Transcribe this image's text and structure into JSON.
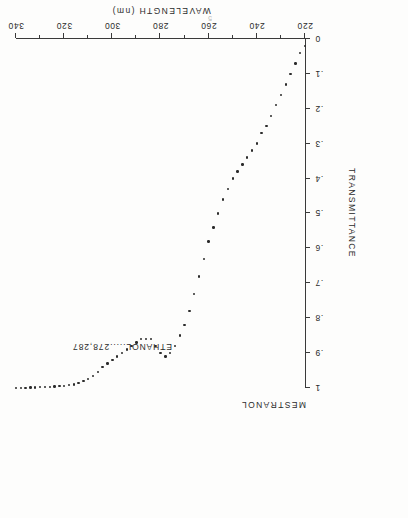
{
  "figure": {
    "title": "MESTRANOL",
    "solvent_annotation": "ETHANOL.....278,287",
    "page_mark": "5"
  },
  "chart_data": {
    "type": "scatter",
    "title": "MESTRANOL",
    "subtitle": "ETHANOL.....278,287",
    "xlabel": "WAVELENGTH (nm)",
    "ylabel": "TRANSMITTANCE",
    "xlim": [
      220,
      340
    ],
    "ylim": [
      0,
      1
    ],
    "xticks": [
      220,
      240,
      260,
      280,
      300,
      320,
      340
    ],
    "xticklabels": [
      "220",
      "240",
      "260",
      "280",
      "300",
      "320",
      "340"
    ],
    "yticks": [
      0,
      0.1,
      0.2,
      0.3,
      0.4,
      0.5,
      0.6,
      0.7,
      0.8,
      0.9,
      1
    ],
    "yticklabels": [
      "0",
      ".1",
      ".2",
      ".3",
      ".4",
      ".5",
      ".6",
      ".7",
      ".8",
      ".9",
      "1"
    ],
    "grid": false,
    "legend": "none",
    "annotations": [
      "ETHANOL.....278,287"
    ],
    "absorption_maxima_nm": [
      278,
      287
    ],
    "series": [
      {
        "name": "Mestranol transmittance",
        "marker": "dot",
        "color": "#2b2b2b",
        "x": [
          220,
          222,
          224,
          226,
          228,
          230,
          232,
          234,
          236,
          238,
          240,
          242,
          244,
          246,
          248,
          250,
          252,
          254,
          256,
          258,
          260,
          262,
          264,
          266,
          268,
          270,
          272,
          274,
          276,
          278,
          280,
          282,
          284,
          285,
          286,
          287,
          288,
          290,
          292,
          294,
          296,
          298,
          300,
          302,
          304,
          306,
          308,
          310,
          312,
          314,
          316,
          318,
          320,
          322,
          324,
          326,
          328,
          330,
          332,
          334,
          336,
          338,
          340
        ],
        "y": [
          0.02,
          0.04,
          0.07,
          0.1,
          0.13,
          0.16,
          0.19,
          0.22,
          0.25,
          0.27,
          0.3,
          0.32,
          0.34,
          0.36,
          0.38,
          0.4,
          0.43,
          0.46,
          0.5,
          0.54,
          0.58,
          0.63,
          0.68,
          0.73,
          0.78,
          0.82,
          0.85,
          0.88,
          0.9,
          0.91,
          0.9,
          0.88,
          0.86,
          0.86,
          0.86,
          0.86,
          0.86,
          0.87,
          0.88,
          0.89,
          0.9,
          0.91,
          0.92,
          0.93,
          0.94,
          0.955,
          0.965,
          0.975,
          0.98,
          0.985,
          0.99,
          0.992,
          0.994,
          0.995,
          0.996,
          0.997,
          0.998,
          0.998,
          0.999,
          0.999,
          1.0,
          1.0,
          1.0
        ]
      }
    ]
  }
}
